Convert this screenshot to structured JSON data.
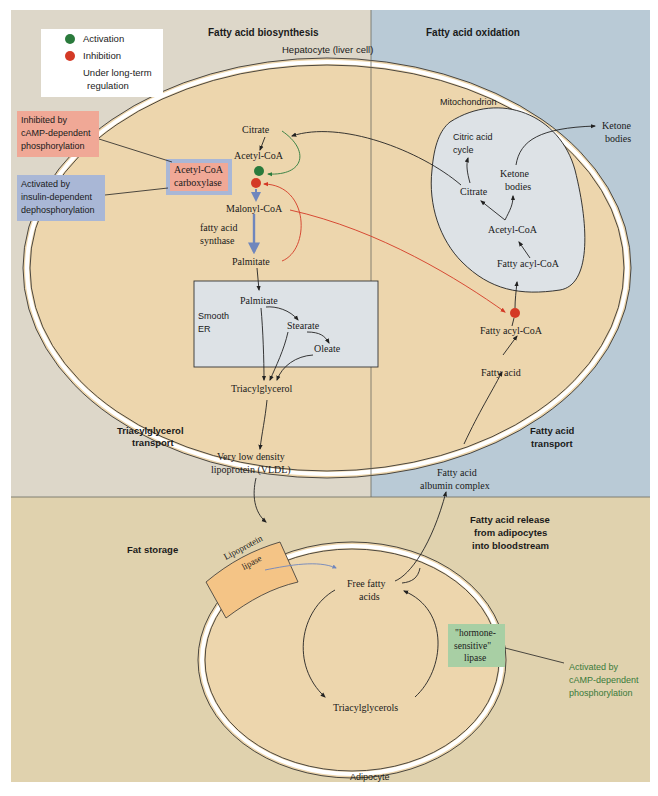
{
  "colors": {
    "panel_beige_top": "#ddd7c9",
    "panel_blue": "#b9cad6",
    "panel_bottom": "#e0d2ae",
    "cell_fill": "#edd6ad",
    "organelle_fill": "#dde2e6",
    "activation": "#2a7a3c",
    "inhibition": "#d43a26",
    "long_term_arrow": "#6f86bd",
    "inhibit_box": "#f0a896",
    "activate_box": "#a9b7d6",
    "hsl_box": "#a8cfa4",
    "lipase_box": "#f4c486",
    "green_text": "#3a7a3a"
  },
  "legend": {
    "items": [
      {
        "symbol": "green-dot",
        "label": "Activation"
      },
      {
        "symbol": "red-dot",
        "label": "Inhibition"
      },
      {
        "symbol": "blue-arrow",
        "label_line1": "Under long-term",
        "label_line2": "regulation"
      }
    ]
  },
  "sections": {
    "biosynthesis": "Fatty acid biosynthesis",
    "oxidation": "Fatty acid oxidation",
    "tg_transport_1": "Triacylglycerol",
    "tg_transport_2": "transport",
    "fa_transport_1": "Fatty acid",
    "fa_transport_2": "transport",
    "fat_storage": "Fat storage",
    "fa_release_1": "Fatty acid release",
    "fa_release_2": "from adipocytes",
    "fa_release_3": "into bloodstream"
  },
  "cells": {
    "hepatocyte": "Hepatocyte (liver cell)",
    "mitochondrion": "Mitochondrion",
    "smooth_er_1": "Smooth",
    "smooth_er_2": "ER",
    "adipocyte": "Adipocyte"
  },
  "regulation": {
    "inhibited_1": "Inhibited by",
    "inhibited_2": "cAMP-dependent",
    "inhibited_3": "phosphorylation",
    "activated_1": "Activated by",
    "activated_2": "insulin-dependent",
    "activated_3": "dephosphorylation",
    "acc_1": "Acetyl-CoA",
    "acc_2": "carboxylase",
    "hsl_1": "\"hormone-",
    "hsl_2": "sensitive\"",
    "hsl_3": "lipase",
    "hsl_act_1": "Activated by",
    "hsl_act_2": "cAMP-dependent",
    "hsl_act_3": "phosphorylation",
    "lpl_1": "Lipoprotein",
    "lpl_2": "lipase"
  },
  "metabolites": {
    "citrate_cyto": "Citrate",
    "acetylcoa_cyto": "Acetyl-CoA",
    "malonylcoa": "Malonyl-CoA",
    "fas_1": "fatty acid",
    "fas_2": "synthase",
    "palmitate_cyto": "Palmitate",
    "palmitate_er": "Palmitate",
    "stearate": "Stearate",
    "oleate": "Oleate",
    "triacylglycerol": "Triacylglycerol",
    "vldl_1": "Very low density",
    "vldl_2": "lipoprotein (VLDL)",
    "cac_1": "Citric acid",
    "cac_2": "cycle",
    "citrate_mito": "Citrate",
    "ketone_mito_1": "Ketone",
    "ketone_mito_2": "bodies",
    "acetylcoa_mito": "Acetyl-CoA",
    "fattyacylcoa_mito": "Fatty acyl-CoA",
    "fattyacylcoa_cyto": "Fatty acyl-CoA",
    "fattyacid_liver": "Fatty acid",
    "ketone_out_1": "Ketone",
    "ketone_out_2": "bodies",
    "fa_albumin_1": "Fatty acid",
    "fa_albumin_2": "albumin complex",
    "ffa_1": "Free fatty",
    "ffa_2": "acids",
    "triacylglycerols": "Triacylglycerols"
  }
}
